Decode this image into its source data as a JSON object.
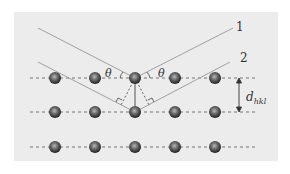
{
  "diagram": {
    "colors": {
      "background": "#ffffff",
      "panel": "#ececec",
      "ray": "#a0a0a0",
      "plane_line": "#555555",
      "atom_dark": "#2e2e2e",
      "atom_light": "#9a9a9a"
    },
    "labels": {
      "ray1": "1",
      "ray2": "2",
      "theta_left": "θ",
      "theta_right": "θ",
      "d_main": "d",
      "d_sub": "hkl"
    },
    "lattice": {
      "columns_x": [
        55,
        95,
        135,
        175,
        215
      ],
      "rows_y": [
        78,
        112,
        147
      ],
      "plane_x_start": 30,
      "plane_x_end": 256
    },
    "rays": [
      {
        "name": "ray-1",
        "incident_from": [
          38,
          28
        ],
        "reflect_at": [
          135,
          78
        ],
        "exit_to": [
          233,
          28
        ]
      },
      {
        "name": "ray-2",
        "incident_from": [
          38,
          62
        ],
        "reflect_at": [
          135,
          112
        ],
        "exit_to": [
          230,
          62
        ]
      }
    ]
  }
}
